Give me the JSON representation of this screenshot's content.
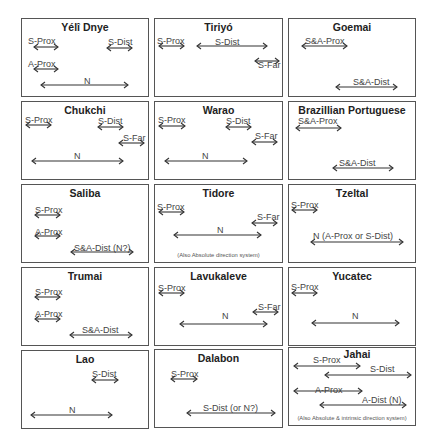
{
  "figure": {
    "panels": [
      {
        "id": "yeli-dnye",
        "title": "Yélî Dnye",
        "box": [
          21,
          18,
          128,
          79
        ],
        "labels": [
          {
            "text": "S-Prox",
            "x": 6,
            "y": 17
          },
          {
            "text": "S-Dist",
            "x": 86,
            "y": 18
          },
          {
            "text": "A-Prox",
            "x": 6,
            "y": 40
          },
          {
            "text": "N",
            "x": 62,
            "y": 57
          }
        ],
        "arrows": [
          {
            "name": "s-prox",
            "x": 11,
            "y": 28,
            "w": 26
          },
          {
            "name": "s-dist",
            "x": 84,
            "y": 29,
            "w": 27
          },
          {
            "name": "a-prox",
            "x": 11,
            "y": 50,
            "w": 26
          },
          {
            "name": "n",
            "x": 18,
            "y": 66,
            "w": 89
          }
        ],
        "note": ""
      },
      {
        "id": "tiriyo",
        "title": "Tiriyó",
        "box": [
          154,
          18,
          129,
          79
        ],
        "labels": [
          {
            "text": "S-Prox",
            "x": 2,
            "y": 17
          },
          {
            "text": "S-Dist",
            "x": 60,
            "y": 18
          },
          {
            "text": "S-Far",
            "x": 103,
            "y": 41
          }
        ],
        "arrows": [
          {
            "name": "s-prox",
            "x": 3,
            "y": 27,
            "w": 27
          },
          {
            "name": "s-dist",
            "x": 41,
            "y": 27,
            "w": 72
          },
          {
            "name": "s-far",
            "x": 99,
            "y": 42,
            "w": 26
          }
        ],
        "note": ""
      },
      {
        "id": "goemai",
        "title": "Goemai",
        "box": [
          288,
          18,
          128,
          79
        ],
        "labels": [
          {
            "text": "S&A-Prox",
            "x": 16,
            "y": 17
          },
          {
            "text": "S&A-Dist",
            "x": 64,
            "y": 58
          }
        ],
        "arrows": [
          {
            "name": "s-a-prox",
            "x": 12,
            "y": 27,
            "w": 47
          },
          {
            "name": "s-a-dist",
            "x": 46,
            "y": 68,
            "w": 63
          }
        ],
        "note": ""
      },
      {
        "id": "chukchi",
        "title": "Chukchi",
        "box": [
          21,
          101,
          128,
          79
        ],
        "labels": [
          {
            "text": "S-Prox",
            "x": 3,
            "y": 13
          },
          {
            "text": "S-Dist",
            "x": 76,
            "y": 14
          },
          {
            "text": "S-Far",
            "x": 101,
            "y": 31
          },
          {
            "text": "N",
            "x": 52,
            "y": 49
          }
        ],
        "arrows": [
          {
            "name": "s-prox",
            "x": 3,
            "y": 23,
            "w": 27
          },
          {
            "name": "s-dist",
            "x": 75,
            "y": 25,
            "w": 27
          },
          {
            "name": "s-far",
            "x": 96,
            "y": 41,
            "w": 27
          },
          {
            "name": "n",
            "x": 9,
            "y": 59,
            "w": 93
          }
        ],
        "note": ""
      },
      {
        "id": "warao",
        "title": "Warao",
        "box": [
          154,
          101,
          129,
          79
        ],
        "labels": [
          {
            "text": "S-Prox",
            "x": 3,
            "y": 13
          },
          {
            "text": "S-Dist",
            "x": 71,
            "y": 14
          },
          {
            "text": "S-Far",
            "x": 100,
            "y": 29
          },
          {
            "text": "N",
            "x": 47,
            "y": 49
          }
        ],
        "arrows": [
          {
            "name": "s-prox",
            "x": 3,
            "y": 24,
            "w": 28
          },
          {
            "name": "s-dist",
            "x": 70,
            "y": 25,
            "w": 27
          },
          {
            "name": "s-far",
            "x": 96,
            "y": 40,
            "w": 27
          },
          {
            "name": "n",
            "x": 9,
            "y": 59,
            "w": 84
          }
        ],
        "note": ""
      },
      {
        "id": "brazilian-portuguese",
        "title": "Brazillian Portuguese",
        "box": [
          288,
          101,
          128,
          79
        ],
        "labels": [
          {
            "text": "S&A-Prox",
            "x": 9,
            "y": 14
          },
          {
            "text": "S&A-Dist",
            "x": 50,
            "y": 56
          }
        ],
        "arrows": [
          {
            "name": "s-a-prox",
            "x": 6,
            "y": 26,
            "w": 47
          },
          {
            "name": "s-a-dist",
            "x": 43,
            "y": 66,
            "w": 62
          }
        ],
        "note": ""
      },
      {
        "id": "saliba",
        "title": "Saliba",
        "box": [
          21,
          184,
          128,
          79
        ],
        "labels": [
          {
            "text": "S-Prox",
            "x": 13,
            "y": 20
          },
          {
            "text": "A-Prox",
            "x": 13,
            "y": 42
          },
          {
            "text": "S&A-Dist (N?)",
            "x": 52,
            "y": 58
          }
        ],
        "arrows": [
          {
            "name": "s-prox",
            "x": 12,
            "y": 30,
            "w": 27
          },
          {
            "name": "a-prox",
            "x": 12,
            "y": 51,
            "w": 27
          },
          {
            "name": "s-a-dist",
            "x": 48,
            "y": 67,
            "w": 64
          }
        ],
        "note": ""
      },
      {
        "id": "tidore",
        "title": "Tidore",
        "box": [
          154,
          184,
          129,
          79
        ],
        "labels": [
          {
            "text": "S-Prox",
            "x": 2,
            "y": 17
          },
          {
            "text": "S-Far",
            "x": 102,
            "y": 27
          },
          {
            "text": "N",
            "x": 62,
            "y": 40
          }
        ],
        "arrows": [
          {
            "name": "s-prox",
            "x": 3,
            "y": 27,
            "w": 27
          },
          {
            "name": "s-far",
            "x": 96,
            "y": 38,
            "w": 27
          },
          {
            "name": "n",
            "x": 18,
            "y": 50,
            "w": 89
          }
        ],
        "note": "(Also Absolute direction system)"
      },
      {
        "id": "tzeltal",
        "title": "Tzeltal",
        "box": [
          288,
          184,
          128,
          79
        ],
        "labels": [
          {
            "text": "S-Prox",
            "x": 2,
            "y": 15
          },
          {
            "text": "N  (A-Prox or S-Dist)",
            "x": 24,
            "y": 46
          }
        ],
        "arrows": [
          {
            "name": "s-prox",
            "x": 2,
            "y": 25,
            "w": 27
          },
          {
            "name": "n",
            "x": 21,
            "y": 57,
            "w": 94
          }
        ],
        "note": ""
      },
      {
        "id": "trumai",
        "title": "Trumai",
        "box": [
          21,
          267,
          128,
          79
        ],
        "labels": [
          {
            "text": "S-Prox",
            "x": 13,
            "y": 19
          },
          {
            "text": "A-Prox",
            "x": 13,
            "y": 41
          },
          {
            "text": "S&A-Dist",
            "x": 60,
            "y": 57
          }
        ],
        "arrows": [
          {
            "name": "s-prox",
            "x": 12,
            "y": 29,
            "w": 27
          },
          {
            "name": "a-prox",
            "x": 12,
            "y": 51,
            "w": 27
          },
          {
            "name": "s-a-dist",
            "x": 47,
            "y": 67,
            "w": 64
          }
        ],
        "note": ""
      },
      {
        "id": "lavukaleve",
        "title": "Lavukaleve",
        "box": [
          154,
          267,
          129,
          79
        ],
        "labels": [
          {
            "text": "S-Prox",
            "x": 3,
            "y": 15
          },
          {
            "text": "S-Far",
            "x": 103,
            "y": 34
          },
          {
            "text": "N",
            "x": 67,
            "y": 43
          }
        ],
        "arrows": [
          {
            "name": "s-prox",
            "x": 3,
            "y": 25,
            "w": 27
          },
          {
            "name": "s-far",
            "x": 97,
            "y": 44,
            "w": 27
          },
          {
            "name": "n",
            "x": 24,
            "y": 56,
            "w": 89
          }
        ],
        "note": ""
      },
      {
        "id": "yucatec",
        "title": "Yucatec",
        "box": [
          288,
          267,
          128,
          79
        ],
        "labels": [
          {
            "text": "S-Prox",
            "x": 2,
            "y": 14
          },
          {
            "text": "N",
            "x": 63,
            "y": 43
          }
        ],
        "arrows": [
          {
            "name": "s-prox",
            "x": 2,
            "y": 25,
            "w": 27
          },
          {
            "name": "n",
            "x": 22,
            "y": 55,
            "w": 89
          }
        ],
        "note": ""
      },
      {
        "id": "lao",
        "title": "Lao",
        "box": [
          21,
          350,
          128,
          79
        ],
        "labels": [
          {
            "text": "S-Dist",
            "x": 70,
            "y": 18
          },
          {
            "text": "N",
            "x": 47,
            "y": 54
          }
        ],
        "arrows": [
          {
            "name": "s-dist",
            "x": 69,
            "y": 29,
            "w": 28
          },
          {
            "name": "n",
            "x": 8,
            "y": 64,
            "w": 83
          }
        ],
        "note": ""
      },
      {
        "id": "dalabon",
        "title": "Dalabon",
        "box": [
          154,
          349,
          129,
          79
        ],
        "labels": [
          {
            "text": "S-Prox",
            "x": 16,
            "y": 19
          },
          {
            "text": "S-Dist  (or N?)",
            "x": 48,
            "y": 53
          }
        ],
        "arrows": [
          {
            "name": "s-prox",
            "x": 15,
            "y": 29,
            "w": 28
          },
          {
            "name": "s-dist",
            "x": 31,
            "y": 63,
            "w": 90
          }
        ],
        "note": ""
      },
      {
        "id": "jahai",
        "title": "Jahai",
        "box": [
          288,
          347,
          128,
          79
        ],
        "labels": [
          {
            "text": "S-Prox",
            "x": 24,
            "y": 7
          },
          {
            "text": "S-Dist",
            "x": 81,
            "y": 16
          },
          {
            "text": "A-Prox",
            "x": 26,
            "y": 37
          },
          {
            "text": "A-Dist  (N)",
            "x": 73,
            "y": 47
          }
        ],
        "arrows": [
          {
            "name": "s-prox",
            "x": 4,
            "y": 18,
            "w": 68
          },
          {
            "name": "s-dist",
            "x": 35,
            "y": 27,
            "w": 88
          },
          {
            "name": "a-prox",
            "x": 4,
            "y": 43,
            "w": 70
          },
          {
            "name": "a-dist",
            "x": 30,
            "y": 57,
            "w": 88
          }
        ],
        "note": "(Also Absolute & intrinsic direction system)",
        "title_offset": 5
      }
    ]
  },
  "colors": {
    "border": "#555555",
    "text": "#444444",
    "title": "#222222",
    "arrow": "#333333"
  }
}
